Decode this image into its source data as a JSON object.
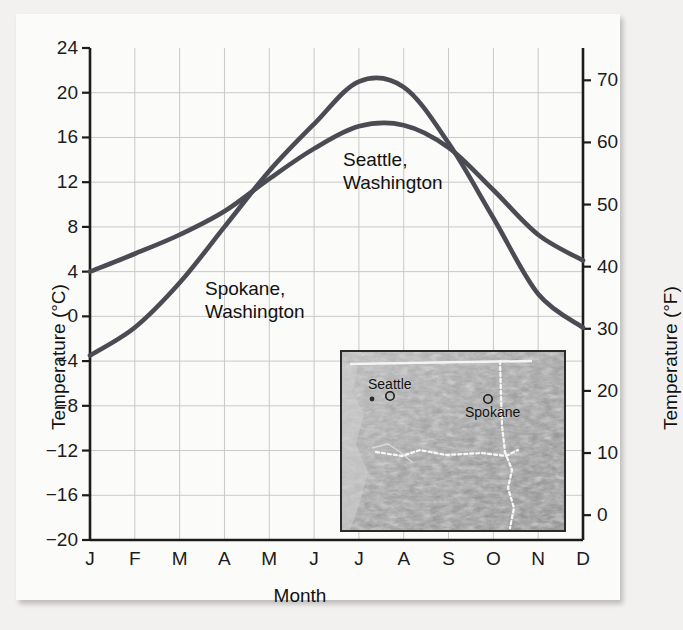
{
  "figure": {
    "background_color": "#fbfbf9",
    "page_color": "#f2f1ef",
    "line_color": "#4b4b54",
    "grid_color": "#c9c9c9",
    "axis_color": "#1c1c1c"
  },
  "chart_data": {
    "type": "line",
    "title": "",
    "xlabel": "Month",
    "ylabel": "Temperature (°C)",
    "ylabel_secondary": "Temperature (°F)",
    "categories": [
      "J",
      "F",
      "M",
      "A",
      "M",
      "J",
      "J",
      "A",
      "S",
      "O",
      "N",
      "D"
    ],
    "month_names": [
      "January",
      "February",
      "March",
      "April",
      "May",
      "June",
      "July",
      "August",
      "September",
      "October",
      "November",
      "December"
    ],
    "ylim": [
      -20,
      24
    ],
    "yticks": [
      -20,
      -16,
      -12,
      -8,
      -4,
      0,
      4,
      8,
      12,
      16,
      20,
      24
    ],
    "ytick_labels": [
      "−20",
      "−16",
      "−12",
      "−8",
      "−4",
      "0",
      "4",
      "8",
      "12",
      "16",
      "20",
      "24"
    ],
    "ylim_secondary": [
      -4,
      75.2
    ],
    "yticks_secondary": [
      0,
      10,
      20,
      30,
      40,
      50,
      60,
      70
    ],
    "ytick_labels_secondary": [
      "0",
      "10",
      "20",
      "30",
      "40",
      "50",
      "60",
      "70"
    ],
    "grid": true,
    "legend": "inline-labels",
    "series": [
      {
        "name": "Seattle, Washington",
        "label_lines": [
          "Seattle,",
          "Washington"
        ],
        "values": [
          4.0,
          5.6,
          7.3,
          9.4,
          12.3,
          15.0,
          17.0,
          17.1,
          15.1,
          11.3,
          7.3,
          5.0
        ]
      },
      {
        "name": "Spokane, Washington",
        "label_lines": [
          "Spokane,",
          "Washington"
        ],
        "values": [
          -3.5,
          -1.0,
          3.0,
          8.0,
          13.0,
          17.2,
          21.0,
          20.5,
          15.5,
          8.8,
          2.0,
          -1.0
        ]
      }
    ]
  },
  "inset_map": {
    "name": "pacific-northwest-relief-map",
    "cities": [
      {
        "label": "Seattle",
        "x_pct": 19,
        "y_pct": 21
      },
      {
        "label": "Spokane",
        "x_pct": 67,
        "y_pct": 32
      }
    ]
  }
}
